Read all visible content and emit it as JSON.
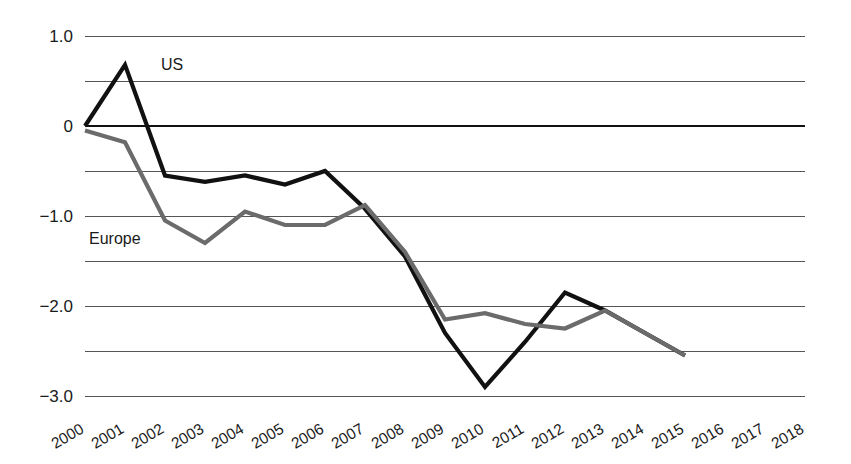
{
  "chart_data": {
    "type": "line",
    "title": "",
    "subtitle": "",
    "xlabel": "",
    "ylabel": "",
    "x": [
      2000,
      2001,
      2002,
      2003,
      2004,
      2005,
      2006,
      2007,
      2008,
      2009,
      2010,
      2011,
      2012,
      2013,
      2014,
      2015
    ],
    "xlim": [
      2000,
      2018
    ],
    "ylim": [
      -3.0,
      1.0
    ],
    "grid": true,
    "grid_axis": "y",
    "legend_position": "inline-annotation",
    "y_ticks": [
      1.0,
      0.5,
      0,
      -0.5,
      -1.0,
      -1.5,
      -2.0,
      -2.5,
      -3.0
    ],
    "y_tick_labels": [
      "1.0",
      "",
      "0",
      "",
      "−1.0",
      "",
      "−2.0",
      "",
      "−3.0"
    ],
    "x_tick_labels": [
      "2000",
      "2001",
      "2002",
      "2003",
      "2004",
      "2005",
      "2006",
      "2007",
      "2008",
      "2009",
      "2010",
      "2011",
      "2012",
      "2013",
      "2014",
      "2015",
      "2016",
      "2017",
      "2018"
    ],
    "series": [
      {
        "name": "US",
        "color": "#111111",
        "width": 4.2,
        "label_x": 2001.9,
        "label_y": 0.68,
        "values": [
          0.0,
          0.68,
          -0.55,
          -0.62,
          -0.55,
          -0.65,
          -0.5,
          -0.92,
          -1.45,
          -2.3,
          -2.9,
          -2.4,
          -1.85,
          -2.05,
          -2.3,
          -2.55
        ]
      },
      {
        "name": "Europe",
        "color": "#6b6b6b",
        "width": 4.2,
        "label_x": 2000.1,
        "label_y": -1.25,
        "values": [
          -0.05,
          -0.18,
          -1.05,
          -1.3,
          -0.95,
          -1.1,
          -1.1,
          -0.88,
          -1.4,
          -2.15,
          -2.08,
          -2.2,
          -2.25,
          -2.05,
          -2.3,
          -2.55
        ]
      }
    ]
  },
  "axis": {
    "y_label_1_0": "1.0",
    "y_label_0": "0",
    "y_label_neg1_0": "−1.0",
    "y_label_neg2_0": "−2.0",
    "y_label_neg3_0": "−3.0"
  },
  "labels": {
    "us": "US",
    "europe": "Europe"
  }
}
